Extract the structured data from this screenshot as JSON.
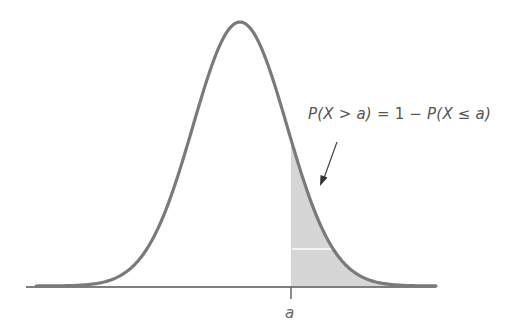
{
  "figure": {
    "type": "normal-distribution-upper-tail",
    "annotation": {
      "text": "P(X > a) = 1 − P(X ≤ a)",
      "parts": [
        "P(X > a)",
        " = 1 − ",
        "P(X ≤ a)"
      ]
    },
    "axis_label": "a",
    "colors": {
      "curve": "#7a7a7a",
      "shade": "#d6d6d6",
      "axis": "#555555",
      "arrow": "#444444",
      "text": "#555555"
    },
    "curve": {
      "center_x": 240,
      "peak_y": 22,
      "baseline_y": 286,
      "sigma_px": 47,
      "x_start": 36,
      "x_end": 436
    },
    "cutoff_x": 291
  }
}
